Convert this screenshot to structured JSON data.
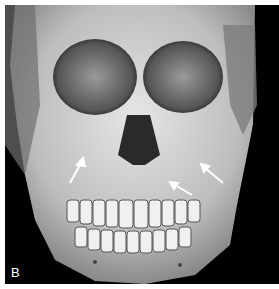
{
  "figure": {
    "panel_label": "B",
    "annotations": [
      {
        "type": "arrow",
        "color": "#ffffff",
        "position": "left maxilla"
      },
      {
        "type": "arrow",
        "color": "#ffffff",
        "position": "right maxilla lower"
      },
      {
        "type": "arrow",
        "color": "#ffffff",
        "position": "right zygomatic"
      }
    ],
    "colors": {
      "background": "#000000",
      "bone": "#d8d8d8",
      "border": "#ffffff"
    }
  }
}
